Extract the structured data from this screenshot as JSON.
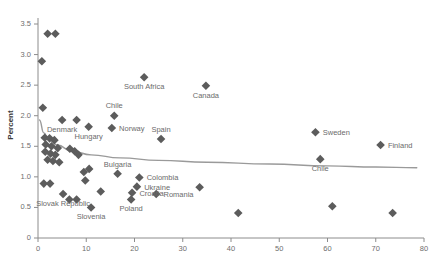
{
  "chart_data": {
    "type": "scatter",
    "title": "",
    "xlabel": "",
    "ylabel": "Percent",
    "xlim": [
      0,
      80
    ],
    "ylim": [
      0,
      3.5
    ],
    "xticks": [
      0,
      10,
      20,
      30,
      40,
      50,
      60,
      70,
      80
    ],
    "yticks": [
      "0",
      "0.5",
      "1.0",
      "1.5",
      "2.0",
      "2.5",
      "3.0",
      "3.5"
    ],
    "ytick_values": [
      0,
      0.5,
      1.0,
      1.5,
      2.0,
      2.5,
      3.0,
      3.5
    ],
    "grid": false,
    "legend": false,
    "marker": "diamond",
    "marker_color": "#5c5c5c",
    "trend_color": "#9a9a9a",
    "points": [
      {
        "x": 2.0,
        "y": 3.34,
        "label": ""
      },
      {
        "x": 3.6,
        "y": 3.34,
        "label": ""
      },
      {
        "x": 0.8,
        "y": 2.89,
        "label": ""
      },
      {
        "x": 1.0,
        "y": 2.13,
        "label": ""
      },
      {
        "x": 22.0,
        "y": 2.63,
        "label": "South Africa",
        "label_pos": "below"
      },
      {
        "x": 34.8,
        "y": 2.49,
        "label": "Canada",
        "label_pos": "below"
      },
      {
        "x": 5.0,
        "y": 1.93,
        "label": "Denmark",
        "label_pos": "below"
      },
      {
        "x": 8.0,
        "y": 1.93,
        "label": "",
        "label_pos": "below"
      },
      {
        "x": 10.5,
        "y": 1.82,
        "label": "Hungary",
        "label_pos": "below"
      },
      {
        "x": 15.8,
        "y": 2.0,
        "label": "Chile",
        "label_pos": "above"
      },
      {
        "x": 15.3,
        "y": 1.8,
        "label": "Norway",
        "label_pos": "right"
      },
      {
        "x": 25.5,
        "y": 1.62,
        "label": "Spain",
        "label_pos": "above"
      },
      {
        "x": 57.5,
        "y": 1.73,
        "label": "Sweden",
        "label_pos": "right"
      },
      {
        "x": 71.0,
        "y": 1.52,
        "label": "Finland",
        "label_pos": "right"
      },
      {
        "x": 58.5,
        "y": 1.29,
        "label": "Chile",
        "label_pos": "below"
      },
      {
        "x": 1.4,
        "y": 1.64,
        "label": ""
      },
      {
        "x": 2.4,
        "y": 1.63,
        "label": ""
      },
      {
        "x": 3.4,
        "y": 1.6,
        "label": ""
      },
      {
        "x": 1.6,
        "y": 1.53,
        "label": ""
      },
      {
        "x": 2.8,
        "y": 1.5,
        "label": ""
      },
      {
        "x": 4.1,
        "y": 1.47,
        "label": ""
      },
      {
        "x": 1.5,
        "y": 1.41,
        "label": ""
      },
      {
        "x": 2.6,
        "y": 1.38,
        "label": ""
      },
      {
        "x": 3.6,
        "y": 1.36,
        "label": ""
      },
      {
        "x": 2.0,
        "y": 1.28,
        "label": ""
      },
      {
        "x": 3.1,
        "y": 1.26,
        "label": ""
      },
      {
        "x": 4.4,
        "y": 1.24,
        "label": ""
      },
      {
        "x": 6.6,
        "y": 1.46,
        "label": ""
      },
      {
        "x": 7.6,
        "y": 1.42,
        "label": ""
      },
      {
        "x": 8.4,
        "y": 1.36,
        "label": ""
      },
      {
        "x": 1.2,
        "y": 0.89,
        "label": ""
      },
      {
        "x": 2.5,
        "y": 0.89,
        "label": ""
      },
      {
        "x": 9.5,
        "y": 1.08,
        "label": ""
      },
      {
        "x": 10.6,
        "y": 1.13,
        "label": ""
      },
      {
        "x": 9.8,
        "y": 0.94,
        "label": ""
      },
      {
        "x": 16.5,
        "y": 1.05,
        "label": "Bulgaria",
        "label_pos": "above"
      },
      {
        "x": 21.0,
        "y": 0.99,
        "label": "Colombia",
        "label_pos": "right"
      },
      {
        "x": 33.5,
        "y": 0.83,
        "label": ""
      },
      {
        "x": 20.5,
        "y": 0.84,
        "label": "Ukraine",
        "label_pos": "right"
      },
      {
        "x": 19.5,
        "y": 0.74,
        "label": "Croatia",
        "label_pos": "right"
      },
      {
        "x": 19.3,
        "y": 0.63,
        "label": "Poland",
        "label_pos": "below"
      },
      {
        "x": 24.5,
        "y": 0.72,
        "label": "Romania",
        "label_pos": "right"
      },
      {
        "x": 13.0,
        "y": 0.76,
        "label": ""
      },
      {
        "x": 6.5,
        "y": 0.63,
        "label": ""
      },
      {
        "x": 8.0,
        "y": 0.63,
        "label": ""
      },
      {
        "x": 5.2,
        "y": 0.72,
        "label": "Slovak Republic",
        "label_pos": "below"
      },
      {
        "x": 11.0,
        "y": 0.5,
        "label": "Slovenia",
        "label_pos": "below"
      },
      {
        "x": 41.5,
        "y": 0.41,
        "label": ""
      },
      {
        "x": 61.0,
        "y": 0.52,
        "label": ""
      },
      {
        "x": 73.5,
        "y": 0.41,
        "label": ""
      }
    ],
    "trend": {
      "name": "fitted-trend",
      "points": [
        {
          "x": 0.3,
          "y": 1.93
        },
        {
          "x": 1.2,
          "y": 1.72
        },
        {
          "x": 2.2,
          "y": 1.62
        },
        {
          "x": 4.0,
          "y": 1.52
        },
        {
          "x": 7.0,
          "y": 1.42
        },
        {
          "x": 11.0,
          "y": 1.36
        },
        {
          "x": 17.0,
          "y": 1.31
        },
        {
          "x": 25.0,
          "y": 1.27
        },
        {
          "x": 35.0,
          "y": 1.24
        },
        {
          "x": 48.0,
          "y": 1.21
        },
        {
          "x": 60.0,
          "y": 1.18
        },
        {
          "x": 70.0,
          "y": 1.16
        },
        {
          "x": 78.5,
          "y": 1.15
        }
      ]
    }
  }
}
